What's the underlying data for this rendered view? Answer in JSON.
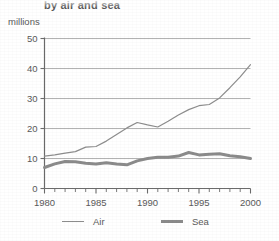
{
  "chart_data": {
    "type": "line",
    "title": "by air and sea",
    "subtitle": "",
    "xlabel": "",
    "ylabel": "millions",
    "x": [
      1980,
      1981,
      1982,
      1983,
      1984,
      1985,
      1986,
      1987,
      1988,
      1989,
      1990,
      1991,
      1992,
      1993,
      1994,
      1995,
      1996,
      1997,
      1998,
      1999,
      2000
    ],
    "xlim": [
      1980,
      2000
    ],
    "ylim": [
      0,
      50
    ],
    "xticks": [
      1980,
      1985,
      1990,
      1995,
      2000
    ],
    "xtick_labels": [
      "1980",
      "1985",
      "1990",
      "1995",
      "2000"
    ],
    "yticks": [
      0,
      10,
      20,
      30,
      40,
      50
    ],
    "ytick_labels": [
      "0",
      "10",
      "20",
      "30",
      "40",
      "50"
    ],
    "minor_xticks_interval": 1,
    "grid": "horizontal",
    "legend_position": "bottom",
    "series": [
      {
        "name": "Air",
        "style": "thin-line",
        "color": "#8d8d8d",
        "values": [
          10.8,
          11.2,
          11.8,
          12.3,
          13.8,
          14.0,
          15.8,
          18.0,
          20.2,
          22.0,
          21.2,
          20.5,
          22.4,
          24.5,
          26.3,
          27.6,
          28.0,
          30.2,
          33.6,
          37.2,
          41.3
        ]
      },
      {
        "name": "Sea",
        "style": "thick-line",
        "color": "#8b8b8b",
        "values": [
          7.0,
          8.2,
          9.0,
          8.9,
          8.4,
          8.2,
          8.6,
          8.2,
          7.9,
          9.2,
          10.0,
          10.4,
          10.4,
          10.8,
          12.0,
          11.2,
          11.4,
          11.6,
          10.9,
          10.6,
          10.0
        ]
      }
    ]
  },
  "legend": {
    "items": [
      {
        "label": "Air"
      },
      {
        "label": "Sea"
      }
    ]
  }
}
